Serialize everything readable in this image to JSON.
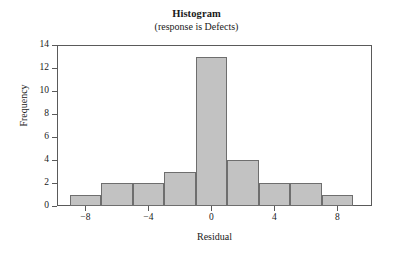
{
  "chart_data": {
    "type": "bar",
    "title": "Histogram",
    "subtitle": "(response is Defects)",
    "xlabel": "Residual",
    "ylabel": "Frequency",
    "grid": false,
    "legend": null,
    "xlim": [
      -9.8,
      10.2
    ],
    "ylim": [
      0,
      14
    ],
    "bin_width": 2,
    "bin_edges": [
      -9,
      -7,
      -5,
      -3,
      -1,
      1,
      3,
      5,
      7,
      9
    ],
    "bin_centers": [
      -8,
      -6,
      -4,
      -2,
      0,
      2,
      4,
      6,
      8
    ],
    "categories": [
      "-8",
      "-6",
      "-4",
      "-2",
      "0",
      "2",
      "4",
      "6",
      "8"
    ],
    "values": [
      1,
      2,
      2,
      3,
      13,
      4,
      2,
      2,
      1
    ],
    "xticks": [
      -8,
      -4,
      0,
      4,
      8
    ],
    "xtick_labels": [
      "−8",
      "−4",
      "0",
      "4",
      "8"
    ],
    "yticks": [
      0,
      2,
      4,
      6,
      8,
      10,
      12,
      14
    ],
    "ytick_labels": [
      "0",
      "2",
      "4",
      "6",
      "8",
      "10",
      "12",
      "14"
    ],
    "bar_fill_color": "#c2c2c2",
    "bar_edge_color": "#6e6e6e",
    "axis_color": "#5a5a5a",
    "background_color": "#ffffff"
  }
}
